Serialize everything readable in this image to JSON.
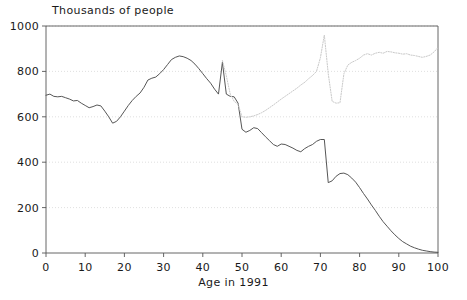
{
  "chart_data": {
    "type": "line",
    "title": "Thousands of people",
    "xlabel": "Age in 1991",
    "ylabel": "",
    "xlim": [
      0,
      100
    ],
    "ylim": [
      0,
      1000
    ],
    "xticks": [
      0,
      10,
      20,
      30,
      40,
      50,
      60,
      70,
      80,
      90,
      100
    ],
    "yticks": [
      0,
      200,
      400,
      600,
      800,
      1000
    ],
    "grid": "horizontal-dotted",
    "legend": "none",
    "colors": {
      "primary_line": "#4d4d4d",
      "secondary_line": "#c9c9c9",
      "axis": "#555555",
      "grid": "#d8d8d8",
      "background": "#ffffff"
    },
    "series": [
      {
        "name": "Population by age 1991",
        "style": "solid",
        "color": "#4d4d4d",
        "x": [
          0,
          1,
          2,
          3,
          4,
          5,
          6,
          7,
          8,
          9,
          10,
          11,
          12,
          13,
          14,
          15,
          16,
          17,
          18,
          19,
          20,
          21,
          22,
          23,
          24,
          25,
          26,
          27,
          28,
          29,
          30,
          31,
          32,
          33,
          34,
          35,
          36,
          37,
          38,
          39,
          40,
          41,
          42,
          43,
          44,
          45,
          46,
          47,
          48,
          49,
          50,
          51,
          52,
          53,
          54,
          55,
          56,
          57,
          58,
          59,
          60,
          61,
          62,
          63,
          64,
          65,
          66,
          67,
          68,
          69,
          70,
          71,
          72,
          73,
          74,
          75,
          76,
          77,
          78,
          79,
          80,
          81,
          82,
          83,
          84,
          85,
          86,
          87,
          88,
          89,
          90,
          91,
          92,
          93,
          94,
          95,
          96,
          97,
          98,
          99,
          100
        ],
        "y": [
          695,
          700,
          690,
          688,
          690,
          684,
          678,
          670,
          672,
          660,
          650,
          640,
          645,
          652,
          648,
          625,
          600,
          572,
          580,
          600,
          625,
          650,
          672,
          690,
          705,
          730,
          762,
          770,
          775,
          790,
          808,
          830,
          852,
          862,
          868,
          865,
          858,
          848,
          832,
          812,
          790,
          768,
          748,
          722,
          700,
          840,
          700,
          690,
          688,
          660,
          545,
          532,
          540,
          552,
          548,
          530,
          512,
          495,
          478,
          470,
          480,
          478,
          470,
          462,
          452,
          446,
          460,
          470,
          478,
          492,
          500,
          500,
          310,
          318,
          338,
          350,
          352,
          345,
          330,
          312,
          288,
          262,
          238,
          212,
          188,
          162,
          138,
          118,
          98,
          80,
          64,
          50,
          40,
          30,
          23,
          17,
          12,
          9,
          6,
          4,
          3
        ]
      },
      {
        "name": "Population by age projected",
        "style": "dotted",
        "color": "#c9c9c9",
        "x": [
          45,
          46,
          47,
          48,
          49,
          50,
          51,
          52,
          53,
          54,
          55,
          56,
          57,
          58,
          59,
          60,
          61,
          62,
          63,
          64,
          65,
          66,
          67,
          68,
          69,
          70,
          71,
          72,
          73,
          74,
          75,
          76,
          77,
          78,
          79,
          80,
          81,
          82,
          83,
          84,
          85,
          86,
          87,
          88,
          89,
          90,
          91,
          92,
          93,
          94,
          95,
          96,
          97,
          98,
          99,
          100
        ],
        "y": [
          848,
          780,
          700,
          668,
          655,
          600,
          598,
          600,
          604,
          610,
          618,
          628,
          640,
          652,
          665,
          678,
          690,
          702,
          714,
          726,
          740,
          752,
          768,
          782,
          800,
          860,
          960,
          790,
          668,
          660,
          662,
          790,
          828,
          840,
          848,
          858,
          872,
          878,
          872,
          880,
          884,
          880,
          888,
          886,
          882,
          880,
          876,
          878,
          872,
          870,
          866,
          862,
          866,
          872,
          886,
          905
        ]
      }
    ]
  }
}
